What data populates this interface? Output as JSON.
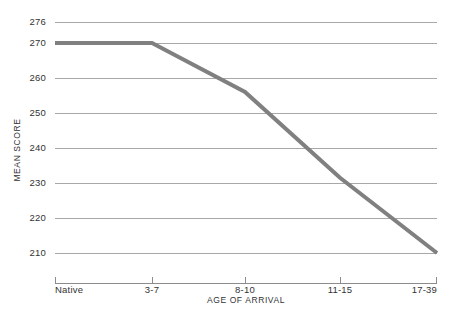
{
  "chart_data": {
    "type": "line",
    "title": "",
    "xlabel": "AGE OF ARRIVAL",
    "ylabel": "MEAN SCORE",
    "categories": [
      "Native",
      "3-7",
      "8-10",
      "11-15",
      "17-39"
    ],
    "values": [
      270,
      270,
      256,
      231.5,
      210
    ],
    "series": [
      {
        "name": "Mean Score",
        "values": [
          270,
          270,
          256,
          231.5,
          210
        ],
        "color": "#808080"
      }
    ],
    "ylim": [
      210,
      276
    ],
    "yticks": [
      276,
      270,
      260,
      250,
      240,
      230,
      220,
      210
    ],
    "ytick_labels": [
      "276",
      "270",
      "260",
      "250",
      "240",
      "230",
      "220",
      "210"
    ],
    "xtick_labels": [
      "Native",
      "3-7",
      "8-10",
      "11-15",
      "17-39"
    ],
    "grid": true,
    "grid_axis": "y",
    "legend": false,
    "legend_position": "none",
    "line_color": "#808080",
    "grid_color": "#a8a8a8",
    "axis_color": "#8c8c8c",
    "background_color": "#ffffff",
    "annotations": []
  },
  "geometry": {
    "plot_left": 55,
    "plot_right": 437,
    "plot_top": 22,
    "plot_bottom": 253,
    "axis_y": 283,
    "tick_length": 6,
    "x_positions": [
      55,
      152,
      245,
      340,
      437
    ],
    "y_positions": [
      22,
      43,
      78,
      113,
      148,
      183,
      218,
      253
    ],
    "xlabel_y": 303,
    "xtick_label_y": 293,
    "ylabel_x": 20,
    "ylabel_y": 150
  }
}
